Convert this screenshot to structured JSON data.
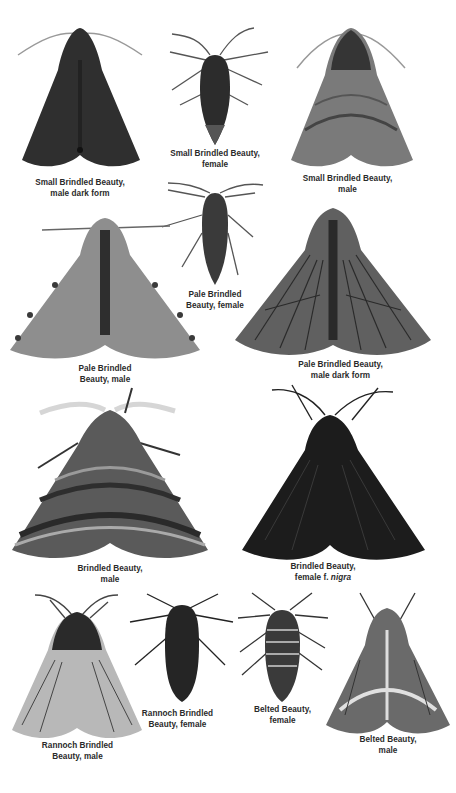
{
  "specimens": [
    {
      "id": "small-brindled-beauty-male-dark",
      "line1": "Small Brindled Beauty,",
      "line2": "male dark form",
      "tone": "dark",
      "shape": "moth"
    },
    {
      "id": "small-brindled-beauty-female",
      "line1": "Small Brindled Beauty,",
      "line2": "female",
      "tone": "dark",
      "shape": "wingless"
    },
    {
      "id": "small-brindled-beauty-male",
      "line1": "Small Brindled Beauty,",
      "line2": "male",
      "tone": "mottled",
      "shape": "moth"
    },
    {
      "id": "pale-brindled-beauty-female",
      "line1": "Pale Brindled",
      "line2": "Beauty, female",
      "tone": "dark",
      "shape": "wingless"
    },
    {
      "id": "pale-brindled-beauty-male",
      "line1": "Pale Brindled",
      "line2": "Beauty, male",
      "tone": "pale",
      "shape": "moth"
    },
    {
      "id": "pale-brindled-beauty-male-dark",
      "line1": "Pale Brindled Beauty,",
      "line2": "male dark form",
      "tone": "veined",
      "shape": "moth"
    },
    {
      "id": "brindled-beauty-male",
      "line1": "Brindled Beauty,",
      "line2": "male",
      "tone": "banded",
      "shape": "moth"
    },
    {
      "id": "brindled-beauty-female-nigra",
      "line1": "Brindled Beauty,",
      "line2_prefix": "female f. ",
      "line2_italic": "nigra",
      "tone": "black",
      "shape": "moth"
    },
    {
      "id": "rannoch-brindled-beauty-male",
      "line1": "Rannoch Brindled",
      "line2": "Beauty, male",
      "tone": "light-veined",
      "shape": "moth"
    },
    {
      "id": "rannoch-brindled-beauty-female",
      "line1": "Rannoch Brindled",
      "line2": "Beauty, female",
      "tone": "dark",
      "shape": "wingless-fat"
    },
    {
      "id": "belted-beauty-female",
      "line1": "Belted Beauty,",
      "line2": "female",
      "tone": "striped",
      "shape": "wingless-fat"
    },
    {
      "id": "belted-beauty-male",
      "line1": "Belted Beauty,",
      "line2": "male",
      "tone": "belted",
      "shape": "moth"
    }
  ],
  "colors": {
    "caption": "#2a2a2a",
    "dark": "#2e2e2e",
    "black": "#151515",
    "mottled": "#6e6e6e",
    "pale": "#8c8c8c",
    "veined": "#5a5a5a",
    "banded": "#4a4a4a",
    "light": "#a8a8a8"
  }
}
